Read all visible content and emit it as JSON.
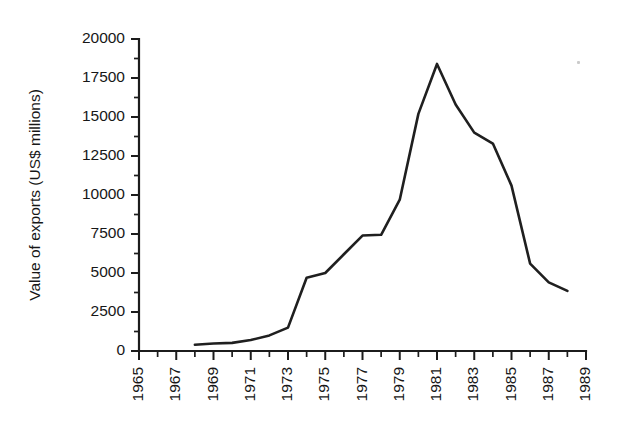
{
  "chart_data": {
    "type": "line",
    "title": "",
    "xlabel": "",
    "ylabel": "Value of exports (US$ millions)",
    "xlim": [
      1965,
      1989
    ],
    "ylim": [
      0,
      20000
    ],
    "grid": false,
    "legend": false,
    "x_tick_labels": [
      "1965",
      "1967",
      "1969",
      "1971",
      "1973",
      "1975",
      "1977",
      "1979",
      "1981",
      "1983",
      "1985",
      "1987",
      "1989"
    ],
    "x_tick_values": [
      1965,
      1967,
      1969,
      1971,
      1973,
      1975,
      1977,
      1979,
      1981,
      1983,
      1985,
      1987,
      1989
    ],
    "x_minor_tick_values": [
      1966,
      1968,
      1970,
      1972,
      1974,
      1976,
      1978,
      1980,
      1982,
      1984,
      1986,
      1988
    ],
    "y_tick_labels": [
      "0",
      "2500",
      "5000",
      "7500",
      "10000",
      "12500",
      "15000",
      "17500",
      "20000"
    ],
    "y_tick_values": [
      0,
      2500,
      5000,
      7500,
      10000,
      12500,
      15000,
      17500,
      20000
    ],
    "y_minor_tick_values": [
      1250,
      3750,
      6250,
      8750,
      11250,
      13750,
      16250,
      18750
    ],
    "series": [
      {
        "name": "Value of exports",
        "color": "#1f1f1f",
        "x": [
          1968,
          1969,
          1970,
          1971,
          1972,
          1973,
          1974,
          1975,
          1976,
          1977,
          1978,
          1979,
          1980,
          1981,
          1982,
          1983,
          1984,
          1985,
          1986,
          1987,
          1988
        ],
        "values": [
          400,
          480,
          520,
          700,
          1000,
          1500,
          4700,
          5000,
          6200,
          7400,
          7450,
          9700,
          15200,
          18400,
          15800,
          14000,
          13300,
          10600,
          5600,
          4400,
          3850
        ]
      }
    ]
  },
  "artifacts": {
    "speck_label": "scan-artifact"
  }
}
